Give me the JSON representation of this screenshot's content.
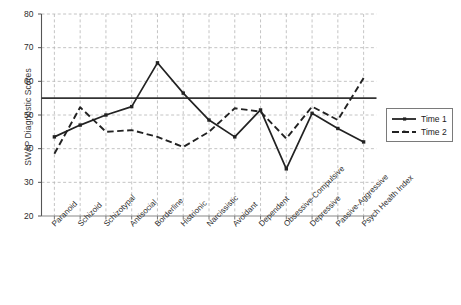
{
  "chart_data": {
    "type": "line",
    "title": "",
    "xlabel": "",
    "ylabel": "SWAP Diagnostic Scores",
    "ylim": [
      20,
      80
    ],
    "yticks": [
      20,
      30,
      40,
      50,
      60,
      70,
      80
    ],
    "grid": true,
    "legend_position": "right",
    "reference_line": {
      "value": 55,
      "style": "solid",
      "color": "#333333"
    },
    "categories": [
      "Paranoid",
      "Schizoid",
      "Schizotypal",
      "Antisocial",
      "Borderline",
      "Histrionic",
      "Narcissistic",
      "Avoidant",
      "Dependent",
      "Obsessive-Compulsive",
      "Depressive",
      "Passive-Aggressive",
      "Psych Health Index"
    ],
    "series": [
      {
        "name": "Time 1",
        "style": "solid",
        "color": "#222222",
        "values": [
          43.5,
          47.0,
          50.0,
          52.5,
          65.5,
          56.5,
          48.5,
          43.5,
          51.5,
          34.0,
          50.5,
          46.0,
          42.0
        ]
      },
      {
        "name": "Time 2",
        "style": "dashed",
        "color": "#222222",
        "values": [
          38.5,
          52.3,
          45.0,
          45.5,
          43.5,
          40.5,
          45.0,
          52.0,
          51.0,
          43.0,
          52.5,
          48.5,
          61.0
        ]
      }
    ]
  },
  "legend": {
    "items": [
      {
        "label": "Time 1"
      },
      {
        "label": "Time 2"
      }
    ]
  }
}
